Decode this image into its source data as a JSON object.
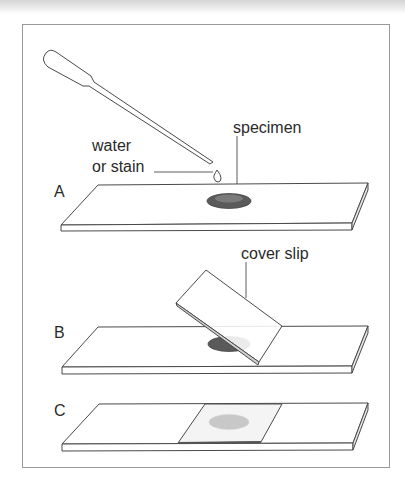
{
  "diagram": {
    "steps": [
      {
        "id": "A",
        "label": "A",
        "description": "Add water or stain to specimen on slide"
      },
      {
        "id": "B",
        "label": "B",
        "description": "Lower cover slip at an angle"
      },
      {
        "id": "C",
        "label": "C",
        "description": "Cover slip in place over specimen"
      }
    ],
    "annotations": {
      "water_line1": "water",
      "water_line2": "or stain",
      "specimen": "specimen",
      "cover_slip": "cover slip"
    },
    "colors": {
      "line": "#4a4a4a",
      "specimen": "#5a5a5a",
      "specimen_faded": "#c8c8c8",
      "frame": "#9a9a9a"
    }
  }
}
